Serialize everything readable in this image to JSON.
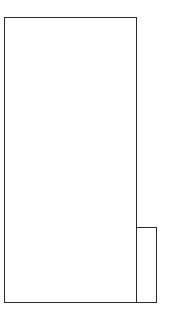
{
  "sketch": {
    "style": "hand-drawn wireframe",
    "stroke_color": "#2a2a2a",
    "background_color": "#ffffff",
    "shapes": [
      {
        "name": "main-panel",
        "type": "rectangle",
        "x": 4,
        "y": 17,
        "width": 133,
        "height": 286
      },
      {
        "name": "side-panel",
        "type": "rectangle",
        "x": 136,
        "y": 227,
        "width": 21,
        "height": 76
      }
    ]
  }
}
